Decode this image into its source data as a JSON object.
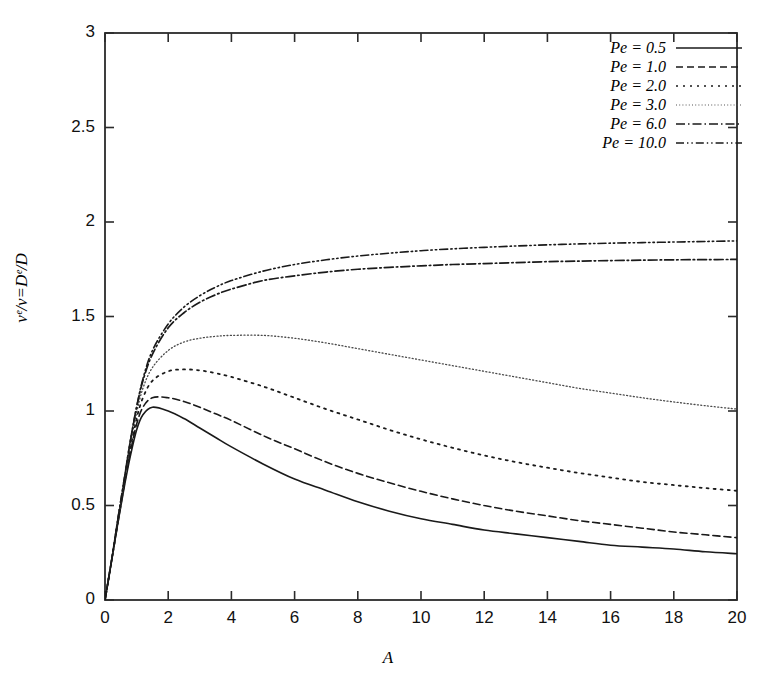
{
  "chart_data": {
    "type": "line",
    "title": "",
    "xlabel": "A",
    "ylabel": "vᵉ/v=Dᵉ/D",
    "xlim": [
      0,
      20
    ],
    "ylim": [
      0,
      3
    ],
    "xticks": [
      0,
      2,
      4,
      6,
      8,
      10,
      12,
      14,
      16,
      18,
      20
    ],
    "xtick_labels": [
      "0",
      "2",
      "4",
      "6",
      "8",
      "10",
      "12",
      "14",
      "16",
      "18",
      "20"
    ],
    "yticks": [
      0,
      0.5,
      1,
      1.5,
      2,
      2.5,
      3
    ],
    "ytick_labels": [
      "0",
      "0.5",
      "1",
      "1.5",
      "2",
      "2.5",
      "3"
    ],
    "grid": false,
    "legend_position": "top-right",
    "x": [
      0,
      0.2,
      0.4,
      0.6,
      0.8,
      1.0,
      1.2,
      1.5,
      2,
      2.5,
      3,
      3.5,
      4,
      5,
      6,
      7,
      8,
      9,
      10,
      11,
      12,
      13,
      14,
      15,
      16,
      17,
      18,
      19,
      20
    ],
    "series": [
      {
        "name": "Pe = 0.5",
        "style": "solid",
        "values": [
          0,
          0.2,
          0.4,
          0.59,
          0.76,
          0.9,
          0.98,
          1.02,
          1.0,
          0.96,
          0.91,
          0.86,
          0.81,
          0.72,
          0.64,
          0.58,
          0.52,
          0.47,
          0.43,
          0.4,
          0.37,
          0.35,
          0.33,
          0.31,
          0.29,
          0.28,
          0.27,
          0.255,
          0.245
        ]
      },
      {
        "name": "Pe = 1.0",
        "style": "dashed",
        "values": [
          0,
          0.2,
          0.4,
          0.6,
          0.78,
          0.93,
          1.02,
          1.07,
          1.07,
          1.05,
          1.02,
          0.985,
          0.95,
          0.87,
          0.8,
          0.73,
          0.67,
          0.62,
          0.575,
          0.535,
          0.5,
          0.47,
          0.445,
          0.42,
          0.4,
          0.38,
          0.36,
          0.345,
          0.33
        ]
      },
      {
        "name": "Pe = 2.0",
        "style": "dotted",
        "values": [
          0,
          0.2,
          0.41,
          0.61,
          0.8,
          0.96,
          1.07,
          1.16,
          1.21,
          1.22,
          1.215,
          1.2,
          1.18,
          1.13,
          1.07,
          1.01,
          0.955,
          0.9,
          0.85,
          0.805,
          0.765,
          0.73,
          0.7,
          0.672,
          0.648,
          0.625,
          0.608,
          0.592,
          0.578
        ]
      },
      {
        "name": "Pe = 3.0",
        "style": "fine-dotted",
        "values": [
          0,
          0.2,
          0.41,
          0.62,
          0.82,
          0.99,
          1.12,
          1.23,
          1.32,
          1.365,
          1.385,
          1.395,
          1.4,
          1.4,
          1.385,
          1.36,
          1.33,
          1.3,
          1.27,
          1.24,
          1.21,
          1.18,
          1.15,
          1.12,
          1.095,
          1.07,
          1.048,
          1.028,
          1.01
        ]
      },
      {
        "name": "Pe = 6.0",
        "style": "dash-dot",
        "values": [
          0,
          0.2,
          0.42,
          0.63,
          0.84,
          1.02,
          1.16,
          1.3,
          1.44,
          1.52,
          1.575,
          1.615,
          1.645,
          1.69,
          1.715,
          1.735,
          1.75,
          1.76,
          1.768,
          1.775,
          1.78,
          1.785,
          1.79,
          1.793,
          1.796,
          1.798,
          1.8,
          1.801,
          1.802
        ]
      },
      {
        "name": "Pe = 10.0",
        "style": "dash-dot-dot",
        "values": [
          0,
          0.2,
          0.42,
          0.63,
          0.84,
          1.02,
          1.17,
          1.32,
          1.46,
          1.55,
          1.61,
          1.655,
          1.69,
          1.74,
          1.775,
          1.8,
          1.82,
          1.835,
          1.848,
          1.858,
          1.866,
          1.873,
          1.879,
          1.884,
          1.888,
          1.891,
          1.894,
          1.897,
          1.9
        ]
      }
    ]
  },
  "legend": {
    "entries": [
      {
        "label": "Pe = 0.5"
      },
      {
        "label": "Pe = 1.0"
      },
      {
        "label": "Pe = 2.0"
      },
      {
        "label": "Pe = 3.0"
      },
      {
        "label": "Pe = 6.0"
      },
      {
        "label": "Pe = 10.0"
      }
    ]
  },
  "axes": {
    "x_title": "A",
    "y_title": "vᵉ/v=Dᵉ/D"
  },
  "colors": {
    "line": "#1a1a1a",
    "axis": "#2b2b2b",
    "background": "#ffffff"
  }
}
